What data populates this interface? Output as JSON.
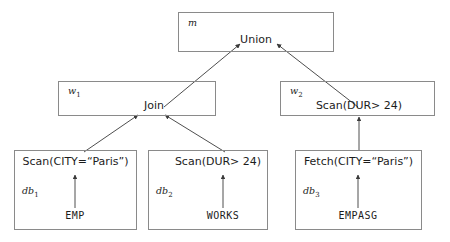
{
  "diagram": {
    "stroke_color": "#8a8a8a",
    "edge_color": "#3a3a3a",
    "text_color": "#1c1c1c",
    "background": "#ffffff",
    "sites": [
      {
        "id": "m",
        "site_label": "m",
        "site_subscript": "",
        "operator": "Union",
        "relation": ""
      },
      {
        "id": "w1",
        "site_label": "w",
        "site_subscript": "1",
        "operator": "Join",
        "relation": ""
      },
      {
        "id": "w2",
        "site_label": "w",
        "site_subscript": "2",
        "operator": "Scan(DUR> 24)",
        "relation": ""
      },
      {
        "id": "db1",
        "site_label": "db",
        "site_subscript": "1",
        "operator": "Scan(CITY=“Paris”)",
        "relation": "EMP"
      },
      {
        "id": "db2",
        "site_label": "db",
        "site_subscript": "2",
        "operator": "Scan(DUR> 24)",
        "relation": "WORKS"
      },
      {
        "id": "db3",
        "site_label": "db",
        "site_subscript": "3",
        "operator": "Fetch(CITY=“Paris”)",
        "relation": "EMPASG"
      }
    ],
    "edges": [
      {
        "from": "w1.Join",
        "to": "m.Union",
        "arrowhead": "to"
      },
      {
        "from": "w2.Scan(DUR> 24)",
        "to": "m.Union",
        "arrowhead": "to"
      },
      {
        "from": "db1.Scan(CITY=“Paris”)",
        "to": "w1.Join",
        "arrowhead": "to"
      },
      {
        "from": "db2.Scan(DUR> 24)",
        "to": "w1.Join",
        "arrowhead": "to"
      },
      {
        "from": "db3.Fetch(CITY=“Paris”)",
        "to": "w2.Scan(DUR> 24)",
        "arrowhead": "to"
      },
      {
        "from": "EMP",
        "to": "db1.Scan(CITY=“Paris”)",
        "arrowhead": "to"
      },
      {
        "from": "WORKS",
        "to": "db2.Scan(DUR> 24)",
        "arrowhead": "to"
      },
      {
        "from": "EMPASG",
        "to": "db3.Fetch(CITY=“Paris”)",
        "arrowhead": "to"
      }
    ]
  }
}
